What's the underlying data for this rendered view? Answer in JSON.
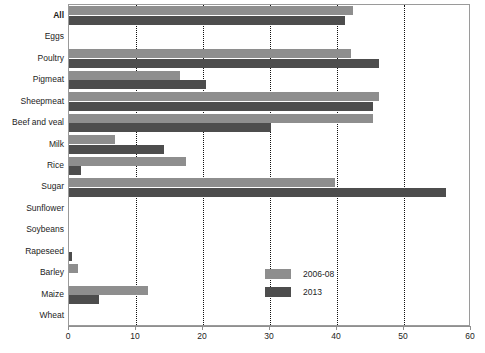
{
  "chart_data": {
    "type": "bar",
    "orientation": "horizontal",
    "title": "",
    "xlabel": "",
    "ylabel": "",
    "xlim": [
      0,
      60
    ],
    "xticks": [
      0,
      10,
      20,
      30,
      40,
      50,
      60
    ],
    "xtick_labels": [
      "0",
      "10",
      "20",
      "30",
      "40",
      "50",
      "60"
    ],
    "grid": "vertical-dotted",
    "legend_position": "inside-bottom-center",
    "categories": [
      "All",
      "Eggs",
      "Poultry",
      "Pigmeat",
      "Sheepmeat",
      "Beef and veal",
      "Milk",
      "Rice",
      "Sugar",
      "Sunflower",
      "Soybeans",
      "Rapeseed",
      "Barley",
      "Maize",
      "Wheat"
    ],
    "emphasized_categories": [
      "All"
    ],
    "series": [
      {
        "name": "2006-08",
        "color": "#8e8e8e",
        "values": [
          42.4,
          0,
          42.1,
          16.6,
          46.3,
          45.4,
          6.8,
          17.5,
          39.7,
          0,
          0,
          0,
          1.3,
          11.8,
          0
        ]
      },
      {
        "name": "2013",
        "color": "#4d4d4d",
        "values": [
          41.2,
          0,
          46.2,
          20.4,
          45.4,
          30.2,
          14.2,
          1.8,
          56.3,
          0,
          0,
          0.4,
          0,
          4.5,
          0
        ]
      }
    ]
  },
  "legend": {
    "items": [
      {
        "label": "2006-08",
        "swatch": "light"
      },
      {
        "label": "2013",
        "swatch": "dark"
      }
    ]
  },
  "colors": {
    "series_2006_08": "#8e8e8e",
    "series_2013": "#4d4d4d",
    "axis": "#8f8f8f",
    "grid": "#111111",
    "background": "#ffffff"
  }
}
